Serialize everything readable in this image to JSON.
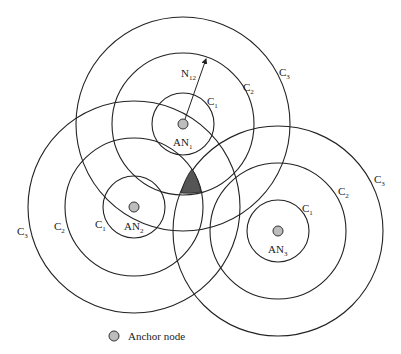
{
  "diagram": {
    "anchors": [
      {
        "name": "AN1",
        "label": "AN",
        "sub": "1",
        "cx": 183,
        "cy": 124,
        "radii": [
          31,
          71,
          107
        ]
      },
      {
        "name": "AN2",
        "label": "AN",
        "sub": "2",
        "cx": 134,
        "cy": 207,
        "radii": [
          31,
          69,
          106
        ]
      },
      {
        "name": "AN3",
        "label": "AN",
        "sub": "3",
        "cx": 278,
        "cy": 231,
        "radii": [
          31,
          68,
          105
        ]
      }
    ],
    "circle_labels": {
      "c": "C",
      "subs": [
        "1",
        "2",
        "3"
      ]
    },
    "arrow": {
      "label": "N",
      "sub": "12"
    },
    "colors": {
      "line": "#222222",
      "node_fill": "#bdbdbd",
      "shaded": "#555555"
    },
    "legend": {
      "label": "Anchor node"
    }
  }
}
